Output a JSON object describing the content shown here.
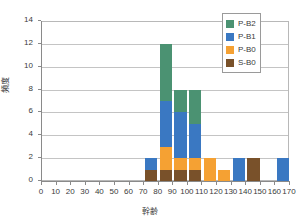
{
  "chart_data": {
    "type": "bar",
    "title": "",
    "subtitle": "",
    "xlabel": "幹齢",
    "ylabel": "頻度",
    "xlim": [
      0,
      170
    ],
    "ylim": [
      0,
      14
    ],
    "xticks": [
      0,
      10,
      20,
      30,
      40,
      50,
      60,
      70,
      80,
      90,
      100,
      110,
      120,
      130,
      140,
      150,
      160,
      170
    ],
    "yticks": [
      0,
      2,
      4,
      6,
      8,
      10,
      12,
      14
    ],
    "grid": "horizontal",
    "stacked": true,
    "legend_position": "top-right",
    "categories": [
      0,
      10,
      20,
      30,
      40,
      50,
      60,
      70,
      80,
      90,
      100,
      110,
      120,
      130,
      140,
      150,
      160
    ],
    "series": [
      {
        "name": "P-B2",
        "color": "#4b9272",
        "values": [
          0,
          0,
          0,
          0,
          0,
          0,
          0,
          0,
          5,
          2,
          3,
          0,
          0,
          0,
          0,
          0,
          0
        ]
      },
      {
        "name": "P-B1",
        "color": "#3a78c2",
        "values": [
          0,
          0,
          0,
          0,
          0,
          0,
          0,
          1,
          4,
          4,
          3,
          0,
          0,
          2,
          0,
          0,
          2
        ]
      },
      {
        "name": "P-B0",
        "color": "#f5a133",
        "values": [
          0,
          0,
          0,
          0,
          0,
          0,
          0,
          0,
          2,
          1,
          1,
          2,
          1,
          0,
          0,
          0,
          0
        ]
      },
      {
        "name": "S-B0",
        "color": "#79512a",
        "values": [
          0,
          0,
          0,
          0,
          0,
          0,
          0,
          1,
          1,
          1,
          1,
          0,
          0,
          0,
          2,
          0,
          0
        ]
      }
    ],
    "totals": [
      0,
      0,
      0,
      0,
      0,
      0,
      0,
      2,
      12,
      8,
      8,
      2,
      1,
      2,
      2,
      0,
      2
    ]
  },
  "legend": {
    "items": [
      {
        "label": "P-B2",
        "color": "#4b9272"
      },
      {
        "label": "P-B1",
        "color": "#3a78c2"
      },
      {
        "label": "P-B0",
        "color": "#f5a133"
      },
      {
        "label": "S-B0",
        "color": "#79512a"
      }
    ]
  },
  "axes": {
    "y_title": "頻度",
    "x_title": "幹齢",
    "y_tick_labels": [
      "0",
      "2",
      "4",
      "6",
      "8",
      "10",
      "12",
      "14"
    ],
    "x_tick_labels": [
      "0",
      "10",
      "20",
      "30",
      "40",
      "50",
      "60",
      "70",
      "80",
      "90",
      "100",
      "110",
      "120",
      "130",
      "140",
      "150",
      "160",
      "170"
    ]
  }
}
